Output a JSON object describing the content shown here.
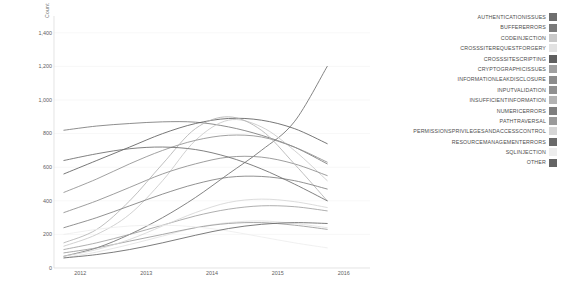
{
  "chart_data": {
    "type": "line",
    "title": "",
    "xlabel": "",
    "ylabel": "Count",
    "xlim": [
      2011.6,
      2016.4
    ],
    "ylim": [
      0,
      1500
    ],
    "grid": true,
    "legend_position": "right",
    "x_ticks": [
      "2012",
      "2013",
      "2014",
      "2015",
      "2016"
    ],
    "x_tick_values": [
      2012,
      2013,
      2014,
      2015,
      2016
    ],
    "y_ticks": [
      "0",
      "200",
      "400",
      "600",
      "800",
      "1,000",
      "1,200",
      "1,400"
    ],
    "y_tick_values": [
      0,
      200,
      400,
      600,
      800,
      1000,
      1200,
      1400
    ],
    "x": [
      2011.75,
      2012.25,
      2012.75,
      2013.25,
      2013.75,
      2014.25,
      2014.75,
      2015.25,
      2015.75
    ],
    "series": [
      {
        "name": "AUTHENTICATIONISSUES",
        "color": "#6e6e6e",
        "values": [
          70,
          120,
          200,
          300,
          420,
          560,
          700,
          870,
          1200
        ]
      },
      {
        "name": "BUFFERERRORS",
        "color": "#7a7a7a",
        "values": [
          820,
          845,
          860,
          870,
          868,
          840,
          790,
          720,
          620
        ]
      },
      {
        "name": "CODEINJECTION",
        "color": "#c9c9c9",
        "values": [
          130,
          200,
          320,
          520,
          760,
          880,
          840,
          700,
          520
        ]
      },
      {
        "name": "CROSSSITEREQUESTFORGERY",
        "color": "#e2e2e2",
        "values": [
          60,
          95,
          140,
          190,
          240,
          270,
          280,
          265,
          240
        ]
      },
      {
        "name": "CROSSSITESCRIPTING",
        "color": "#5f5f5f",
        "values": [
          560,
          640,
          720,
          800,
          860,
          890,
          880,
          830,
          740
        ]
      },
      {
        "name": "CRYPTOGRAPHICISSUES",
        "color": "#a0a0a0",
        "values": [
          110,
          150,
          200,
          255,
          310,
          350,
          370,
          365,
          340
        ]
      },
      {
        "name": "INFORMATIONLEAKDISCLOSURE",
        "color": "#8c8c8c",
        "values": [
          330,
          400,
          480,
          560,
          620,
          660,
          660,
          620,
          550
        ]
      },
      {
        "name": "INPUTVALIDATION",
        "color": "#909090",
        "values": [
          450,
          530,
          620,
          700,
          760,
          790,
          780,
          720,
          630
        ]
      },
      {
        "name": "INSUFFICIENTINFORMATION",
        "color": "#b3b3b3",
        "values": [
          150,
          230,
          400,
          620,
          830,
          900,
          820,
          620,
          400
        ]
      },
      {
        "name": "NUMERICERRORS",
        "color": "#7e7e7e",
        "values": [
          240,
          300,
          370,
          440,
          500,
          540,
          545,
          520,
          470
        ]
      },
      {
        "name": "PATHTRAVERSAL",
        "color": "#9a9a9a",
        "values": [
          90,
          120,
          160,
          200,
          240,
          265,
          270,
          255,
          230
        ]
      },
      {
        "name": "PERMISSIONSPRIVILEGESANDACCESSCONTROL",
        "color": "#d6d6d6",
        "values": [
          70,
          110,
          170,
          250,
          330,
          390,
          410,
          395,
          360
        ]
      },
      {
        "name": "RESOURCEMANAGEMENTERRORS",
        "color": "#6a6a6a",
        "values": [
          640,
          680,
          710,
          720,
          705,
          660,
          590,
          500,
          400
        ]
      },
      {
        "name": "SQLINJECTION",
        "color": "#ededed",
        "values": [
          200,
          230,
          250,
          255,
          245,
          220,
          185,
          150,
          120
        ]
      },
      {
        "name": "OTHER",
        "color": "#646464",
        "values": [
          60,
          80,
          110,
          150,
          195,
          235,
          260,
          270,
          265
        ]
      }
    ]
  },
  "legend": {
    "items": [
      {
        "label": "AUTHENTICATIONISSUES",
        "color": "#6e6e6e"
      },
      {
        "label": "BUFFERERRORS",
        "color": "#7a7a7a"
      },
      {
        "label": "CODEINJECTION",
        "color": "#c9c9c9"
      },
      {
        "label": "CROSSSITEREQUESTFORGERY",
        "color": "#e2e2e2"
      },
      {
        "label": "CROSSSITESCRIPTING",
        "color": "#5f5f5f"
      },
      {
        "label": "CRYPTOGRAPHICISSUES",
        "color": "#a0a0a0"
      },
      {
        "label": "INFORMATIONLEAKDISCLOSURE",
        "color": "#8c8c8c"
      },
      {
        "label": "INPUTVALIDATION",
        "color": "#909090"
      },
      {
        "label": "INSUFFICIENTINFORMATION",
        "color": "#b3b3b3"
      },
      {
        "label": "NUMERICERRORS",
        "color": "#7e7e7e"
      },
      {
        "label": "PATHTRAVERSAL",
        "color": "#9a9a9a"
      },
      {
        "label": "PERMISSIONSPRIVILEGESANDACCESSCONTROL",
        "color": "#d6d6d6"
      },
      {
        "label": "RESOURCEMANAGEMENTERRORS",
        "color": "#6a6a6a"
      },
      {
        "label": "SQLINJECTION",
        "color": "#ededed"
      },
      {
        "label": "OTHER",
        "color": "#646464"
      }
    ]
  },
  "style": {
    "grid_color": "#f2f2f2",
    "axis_color": "#d8d8d8",
    "tick_text_color": "#5e5e5e",
    "background": "#ffffff"
  }
}
